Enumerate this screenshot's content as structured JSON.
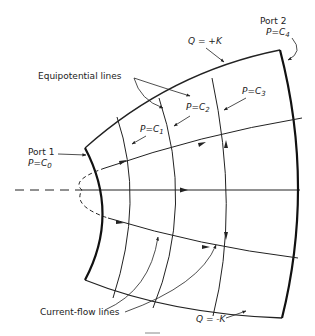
{
  "figure": {
    "labels": {
      "port1_name": "Port 1",
      "port1_value": "P=C",
      "port1_sub": "0",
      "port2_name": "Port 2",
      "port2_value": "P=C",
      "port2_sub": "4",
      "q_top": "Q = +K",
      "q_bottom": "Q = -K",
      "equipotential": "Equipotential  lines",
      "current_flow": "Current-flow lines",
      "p1": "P=C",
      "p1_sub": "1",
      "p2": "P=C",
      "p2_sub": "2",
      "p3": "P=C",
      "p3_sub": "3"
    },
    "colors": {
      "ink": "#222222",
      "background": "#ffffff"
    }
  }
}
